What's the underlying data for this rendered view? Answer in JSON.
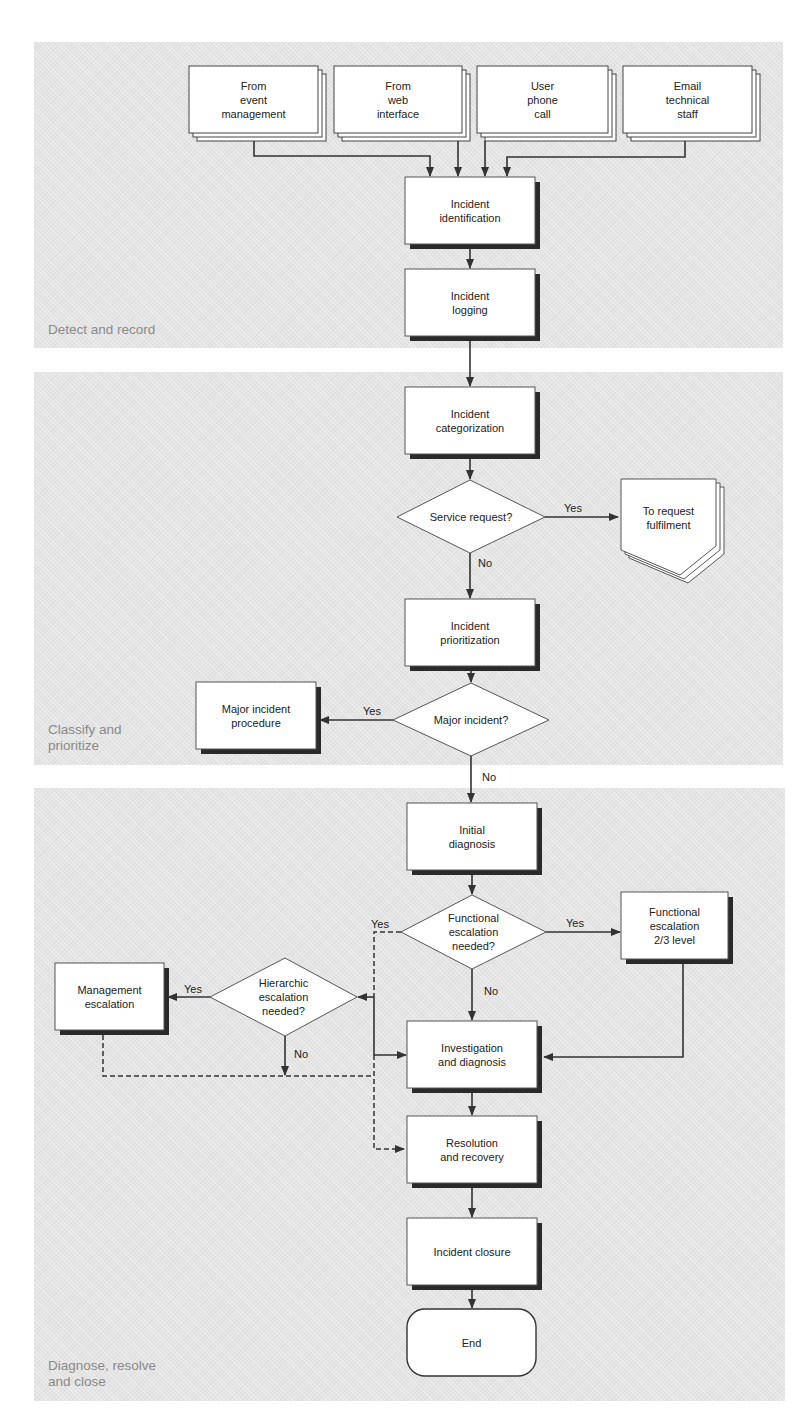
{
  "diagram": {
    "colors": {
      "panel_fill": "#e4e4e4",
      "box_fill": "#ffffff",
      "stroke": "#333333",
      "shadow": "#2a2a2a",
      "label_gray": "#8a8a8a"
    },
    "phases": [
      {
        "id": "detect",
        "label": "Detect and record"
      },
      {
        "id": "classify",
        "label": "Classify and\nprioritize"
      },
      {
        "id": "diagnose",
        "label": "Diagnose, resolve\nand close"
      }
    ],
    "inputs": [
      {
        "id": "event",
        "label": "From\nevent\nmanagement"
      },
      {
        "id": "web",
        "label": "From\nweb\ninterface"
      },
      {
        "id": "phone",
        "label": "User\nphone\ncall"
      },
      {
        "id": "email",
        "label": "Email\ntechnical\nstaff"
      }
    ],
    "nodes": {
      "identification": "Incident\nidentification",
      "logging": "Incident\nlogging",
      "categorization": "Incident\ncategorization",
      "service_request": "Service request?",
      "request_fulfilment": "To request\nfulfilment",
      "prioritization": "Incident\nprioritization",
      "major_incident": "Major incident?",
      "major_procedure": "Major incident\nprocedure",
      "initial_diagnosis": "Initial\ndiagnosis",
      "functional_escalation_q": "Functional\nescalation\nneeded?",
      "functional_escalation": "Functional\nescalation\n2/3 level",
      "hierarchic_escalation_q": "Hierarchic\nescalation\nneeded?",
      "management_escalation": "Management\nescalation",
      "investigation": "Investigation\nand diagnosis",
      "resolution": "Resolution\nand recovery",
      "closure": "Incident closure",
      "end": "End"
    },
    "edge_labels": {
      "service_yes": "Yes",
      "service_no": "No",
      "major_yes": "Yes",
      "major_no": "No",
      "func_yes_right": "Yes",
      "func_yes_left": "Yes",
      "func_no": "No",
      "hier_yes": "Yes",
      "hier_no": "No"
    }
  }
}
